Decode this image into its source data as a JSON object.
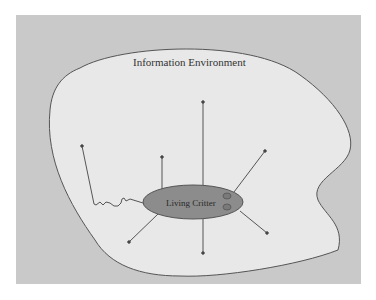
{
  "diagram": {
    "environment_label": "Information Environment",
    "critter_label": "Living Critter",
    "colors": {
      "background": "#c9c9c9",
      "environment_fill": "#e8e8e8",
      "outline": "#555555",
      "critter_fill": "#8c8c8c",
      "arrow": "#555555"
    },
    "arrows": [
      {
        "direction": "up",
        "to": [
          203,
          103
        ]
      },
      {
        "direction": "up-left",
        "to": [
          162,
          158
        ]
      },
      {
        "direction": "up-right",
        "to": [
          265,
          151
        ]
      },
      {
        "direction": "down-left",
        "to": [
          129,
          242
        ]
      },
      {
        "direction": "down",
        "to": [
          203,
          253
        ]
      },
      {
        "direction": "down-right",
        "to": [
          267,
          233
        ]
      },
      {
        "direction": "wiggly-tail-up-left",
        "to": [
          82,
          146
        ]
      }
    ]
  }
}
